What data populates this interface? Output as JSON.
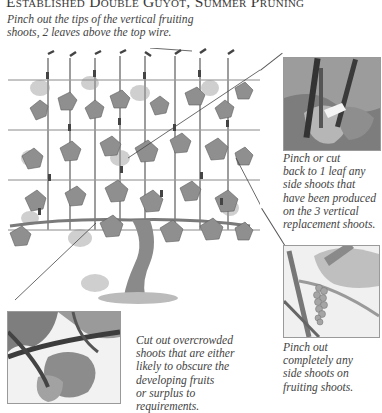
{
  "page": {
    "title": "Established Double Guyot, Summer Pruning"
  },
  "captions": {
    "top": [
      "Pinch out the tips of the vertical fruiting",
      "shoots, 2 leaves above the top wire."
    ],
    "right_upper": [
      "Pinch or cut",
      "back to 1 leaf any",
      "side shoots that",
      "have been produced",
      "on the 3 vertical",
      "replacement shoots."
    ],
    "right_lower": [
      "Pinch out",
      "completely any",
      "side shoots on",
      "fruiting shoots."
    ],
    "bottom_center": [
      "Cut out overcrowded",
      "shoots that are either",
      "likely to obscure the",
      "developing fruits",
      "or surplus to",
      "requirements."
    ]
  },
  "figures": {
    "main": "grapevine-trained-on-wires-illustration",
    "photo_upper_right": "vine-leaf-side-shoot-photo",
    "photo_lower_right": "hand-pinching-side-shoot-grape-cluster-photo",
    "photo_bottom_left": "overcrowded-vine-shoots-photo"
  },
  "colors": {
    "text": "#444444",
    "wire": "#8a8a8a",
    "leaf": "#8f8f8f",
    "leaf_light": "#c6c6c6"
  }
}
